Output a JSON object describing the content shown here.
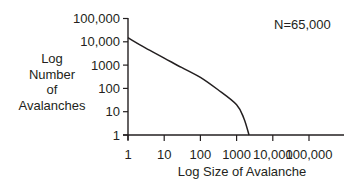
{
  "chart_data": {
    "type": "line",
    "title": "",
    "annotation": "N=65,000",
    "xlabel": "Log Size of Avalanche",
    "ylabel": "Log Number of Avalanches",
    "ylabel_lines": [
      "Log",
      "Number",
      "of",
      "Avalanches"
    ],
    "xscale": "log",
    "yscale": "log",
    "xlim": [
      1,
      1000000
    ],
    "ylim": [
      1,
      100000
    ],
    "x_ticks": [
      1,
      10,
      100,
      1000,
      10000,
      100000
    ],
    "x_tick_labels": [
      "1",
      "10",
      "100",
      "1000",
      "10,000",
      "100,000"
    ],
    "y_ticks": [
      1,
      10,
      100,
      1000,
      10000,
      100000
    ],
    "y_tick_labels": [
      "1",
      "10",
      "100",
      "1000",
      "10,000",
      "100,000"
    ],
    "grid": false,
    "legend": null,
    "series": [
      {
        "name": "Avalanche distribution",
        "x": [
          1,
          3,
          10,
          30,
          100,
          300,
          1000,
          1600,
          2200
        ],
        "y": [
          15000,
          5500,
          2000,
          800,
          300,
          90,
          20,
          5,
          1
        ]
      }
    ]
  },
  "ui": {
    "annotation": "N=65,000",
    "xlabel": "Log Size of Avalanche",
    "ylabel_lines": [
      "Log",
      "Number",
      "of",
      "Avalanches"
    ]
  }
}
